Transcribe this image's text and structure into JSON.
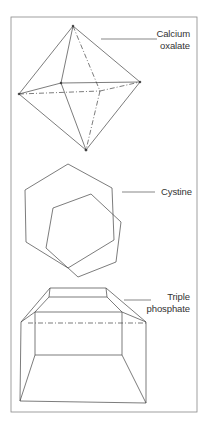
{
  "figure": {
    "labels": {
      "calcium_oxalate": {
        "line1": "Calcium",
        "line2": "oxalate"
      },
      "cystine": {
        "line1": "Cystine"
      },
      "triple_phosphate": {
        "line1": "Triple",
        "line2": "phosphate"
      }
    },
    "colors": {
      "stroke": "#444444",
      "frame": "#777777",
      "text": "#333333"
    },
    "crystals": [
      "Calcium oxalate",
      "Cystine",
      "Triple phosphate"
    ]
  }
}
